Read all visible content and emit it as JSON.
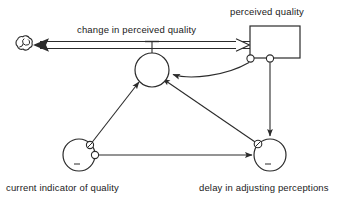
{
  "diagram": {
    "type": "system-dynamics-stock-and-flow",
    "background_color": "#ffffff",
    "line_color": "#2b2b2b",
    "text_color": "#1a1a1a",
    "width": 364,
    "height": 204,
    "stock": {
      "id": "perceived-quality",
      "label": "perceived quality",
      "shape": "rectangle",
      "x": 250,
      "y": 26,
      "width": 50,
      "height": 32,
      "label_x": 230,
      "label_y": 8
    },
    "flow": {
      "id": "change-in-perceived-quality",
      "label": "change in perceived quality",
      "label_x": 77,
      "label_y": 26,
      "valve": {
        "cx": 152,
        "cy": 70,
        "r": 17
      },
      "source_cloud": {
        "cx": 24,
        "cy": 45,
        "r": 11
      },
      "pipe_y": 45,
      "direction": "stock-to-cloud (outflow drawn leftward)"
    },
    "auxiliaries": [
      {
        "id": "current-indicator-of-quality",
        "label": "current indicator of quality",
        "cx": 79,
        "cy": 155,
        "r": 16,
        "label_x": 6,
        "label_y": 184
      },
      {
        "id": "delay-in-adjusting-perceptions",
        "label": "delay in adjusting perceptions",
        "cx": 270,
        "cy": 155,
        "r": 16,
        "label_x": 199,
        "label_y": 184
      }
    ],
    "connectors": [
      {
        "id": "stock-to-valve",
        "from": "perceived-quality",
        "to": "change-in-perceived-quality",
        "style": "curved"
      },
      {
        "id": "stock-to-delay",
        "from": "perceived-quality",
        "to": "delay-in-adjusting-perceptions",
        "style": "straight-vertical"
      },
      {
        "id": "indicator-to-valve",
        "from": "current-indicator-of-quality",
        "to": "change-in-perceived-quality",
        "style": "straight-diagonal"
      },
      {
        "id": "indicator-to-delay",
        "from": "current-indicator-of-quality",
        "to": "delay-in-adjusting-perceptions",
        "style": "straight-horizontal"
      },
      {
        "id": "delay-to-valve",
        "from": "delay-in-adjusting-perceptions",
        "to": "change-in-perceived-quality",
        "style": "straight-diagonal"
      }
    ]
  }
}
